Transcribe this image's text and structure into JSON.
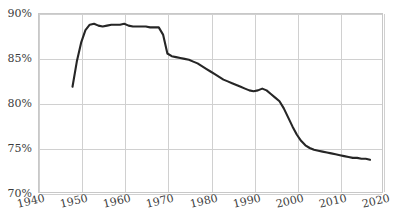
{
  "chart_data": {
    "type": "line",
    "title": "",
    "subtitle": "",
    "xlabel": "",
    "ylabel": "",
    "xlim": [
      1940,
      2020
    ],
    "ylim": [
      70,
      90
    ],
    "grid": true,
    "legend": null,
    "y_tick_labels": [
      "90%",
      "85%",
      "80%",
      "75%",
      "70%"
    ],
    "y_ticks": [
      90,
      85,
      80,
      75,
      70
    ],
    "x_tick_labels": [
      "1940",
      "1950",
      "1960",
      "1970",
      "1980",
      "1990",
      "2000",
      "2010",
      "2020"
    ],
    "x_ticks": [
      1940,
      1950,
      1960,
      1970,
      1980,
      1990,
      2000,
      2010,
      2020
    ],
    "series": [
      {
        "name": "series-1",
        "color": "#262626",
        "x": [
          1948,
          1949,
          1950,
          1951,
          1952,
          1953,
          1954,
          1955,
          1956,
          1957,
          1958,
          1959,
          1960,
          1961,
          1962,
          1963,
          1964,
          1965,
          1966,
          1967,
          1968,
          1969,
          1970,
          1971,
          1972,
          1973,
          1974,
          1975,
          1976,
          1977,
          1978,
          1979,
          1980,
          1981,
          1982,
          1983,
          1984,
          1985,
          1986,
          1987,
          1988,
          1989,
          1990,
          1991,
          1992,
          1993,
          1994,
          1995,
          1996,
          1997,
          1998,
          1999,
          2000,
          2001,
          2002,
          2003,
          2004,
          2005,
          2006,
          2007,
          2008,
          2009,
          2010,
          2011,
          2012,
          2013,
          2014,
          2015,
          2016,
          2017
        ],
        "values": [
          81.8,
          84.6,
          86.7,
          88.1,
          88.7,
          88.8,
          88.6,
          88.5,
          88.6,
          88.7,
          88.7,
          88.7,
          88.8,
          88.6,
          88.5,
          88.5,
          88.5,
          88.5,
          88.4,
          88.4,
          88.4,
          87.6,
          85.5,
          85.2,
          85.1,
          85.0,
          84.9,
          84.8,
          84.6,
          84.4,
          84.1,
          83.8,
          83.5,
          83.2,
          82.9,
          82.6,
          82.4,
          82.2,
          82.0,
          81.8,
          81.6,
          81.4,
          81.3,
          81.4,
          81.6,
          81.4,
          81.0,
          80.6,
          80.2,
          79.4,
          78.4,
          77.4,
          76.5,
          75.8,
          75.3,
          75.0,
          74.8,
          74.7,
          74.6,
          74.5,
          74.4,
          74.3,
          74.2,
          74.1,
          74.0,
          73.9,
          73.9,
          73.8,
          73.8,
          73.7
        ]
      }
    ]
  },
  "axes": {
    "y_axis_name": "y-axis",
    "x_axis_name": "x-axis"
  }
}
